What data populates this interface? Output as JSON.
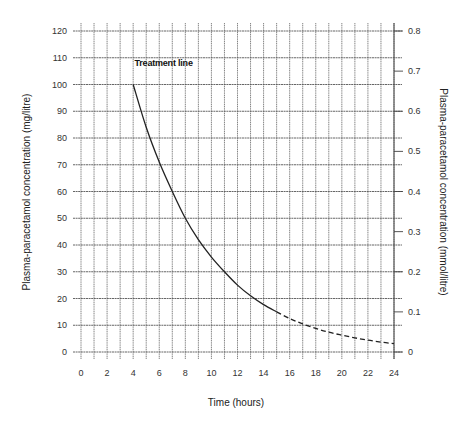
{
  "chart_data": {
    "type": "line",
    "title": "",
    "xlabel": "Time (hours)",
    "ylabel": "Plasma-paracetamol concentration (mg/litre)",
    "y2label": "Plasma-paracetamol concentration (mmol/litre)",
    "xlim": [
      0,
      24
    ],
    "ylim": [
      0,
      120
    ],
    "y2lim": [
      0,
      0.8
    ],
    "x_ticks": [
      0,
      2,
      4,
      6,
      8,
      10,
      12,
      14,
      16,
      18,
      20,
      22,
      24
    ],
    "y_ticks": [
      0,
      10,
      20,
      30,
      40,
      50,
      60,
      70,
      80,
      90,
      100,
      110,
      120
    ],
    "y2_ticks": [
      0,
      0.1,
      0.2,
      0.3,
      0.4,
      0.5,
      0.6,
      0.7,
      0.8
    ],
    "grid": true,
    "grid_x_step": 1,
    "grid_y_step": 10,
    "legend": null,
    "annotations": [
      {
        "text": "Treatment line",
        "x": 4.1,
        "y": 107
      }
    ],
    "series": [
      {
        "name": "Treatment line",
        "color": "#222222",
        "solid_until_x": 15,
        "x": [
          4,
          5,
          6,
          7,
          8,
          9,
          10,
          11,
          12,
          13,
          14,
          15,
          16,
          17,
          18,
          19,
          20,
          21,
          22,
          23,
          24
        ],
        "values": [
          100,
          84,
          71,
          60,
          50,
          42,
          35.5,
          30,
          25,
          21,
          17.7,
          15,
          12.5,
          10.5,
          8.8,
          7.4,
          6.3,
          5.3,
          4.4,
          3.7,
          3.1
        ]
      }
    ]
  }
}
